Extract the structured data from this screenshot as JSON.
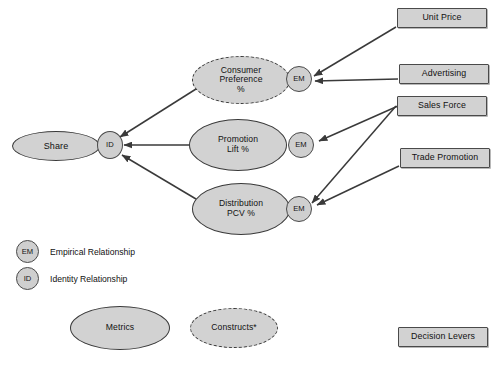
{
  "diagram": {
    "colors": {
      "node_fill": "#d2d2d2",
      "node_stroke": "#3a3a3a",
      "lever_fill": "#d2d2d2",
      "lever_stroke": "#4a4a4a",
      "edge_stroke": "#3a3a3a",
      "background": "#ffffff",
      "text": "#111111"
    }
  },
  "nodes": {
    "share": {
      "label": "Share",
      "shape": "ellipse-solid"
    },
    "identity": {
      "label": "ID",
      "shape": "circle"
    },
    "consumer_preference": {
      "label": "Consumer\nPreference\n%",
      "shape": "ellipse-dashed"
    },
    "promotion_lift": {
      "label": "Promotion\nLift %",
      "shape": "ellipse-solid"
    },
    "distribution_pcv": {
      "label": "Distribution\nPCV %",
      "shape": "ellipse-solid"
    }
  },
  "relationship_tags": {
    "em_consumer": "EM",
    "em_promotion": "EM",
    "em_distribution": "EM"
  },
  "levers": [
    {
      "id": "unit_price",
      "label": "Unit Price"
    },
    {
      "id": "advertising",
      "label": "Advertising"
    },
    {
      "id": "sales_force",
      "label": "Sales Force"
    },
    {
      "id": "trade_promotion",
      "label": "Trade Promotion"
    }
  ],
  "legend": {
    "relationships": [
      {
        "tag": "EM",
        "label": "Empirical Relationship"
      },
      {
        "tag": "ID",
        "label": "Identity Relationship"
      }
    ],
    "shapes": [
      {
        "id": "metrics",
        "label": "Metrics",
        "shape": "ellipse-solid"
      },
      {
        "id": "constructs",
        "label": "Constructs*",
        "shape": "ellipse-dashed"
      }
    ],
    "lever_key": {
      "id": "decision_levers",
      "label": "Decision Levers"
    }
  },
  "edges": [
    {
      "from": "consumer_preference",
      "to": "identity"
    },
    {
      "from": "promotion_lift",
      "to": "identity"
    },
    {
      "from": "distribution_pcv",
      "to": "identity"
    },
    {
      "from": "unit_price",
      "to": "em_consumer"
    },
    {
      "from": "advertising",
      "to": "em_consumer"
    },
    {
      "from": "sales_force",
      "to": "em_promotion"
    },
    {
      "from": "sales_force",
      "to": "em_distribution"
    },
    {
      "from": "trade_promotion",
      "to": "em_distribution"
    }
  ]
}
